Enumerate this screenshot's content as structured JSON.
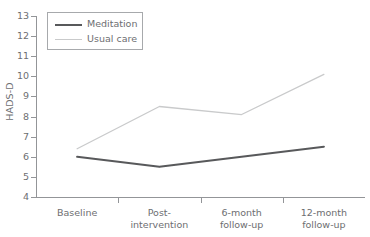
{
  "chart_data": {
    "type": "line",
    "title": "",
    "xlabel": "",
    "ylabel": "HADS-D",
    "categories": [
      "Baseline",
      "Post-\nintervention",
      "6-month\nfollow-up",
      "12-month\nfollow-up"
    ],
    "ylim": [
      4,
      13
    ],
    "yticks": [
      4,
      5,
      6,
      7,
      8,
      9,
      10,
      11,
      12,
      13
    ],
    "grid": false,
    "legend_position": "upper-left-inside",
    "series": [
      {
        "name": "Meditation",
        "color": "#58595b",
        "values": [
          6.0,
          5.5,
          6.0,
          6.5
        ]
      },
      {
        "name": "Usual care",
        "color": "#c9cacb",
        "values": [
          6.4,
          8.5,
          8.1,
          10.1
        ]
      }
    ]
  },
  "axes": {
    "y_label": "HADS-D",
    "y_ticks": [
      "13",
      "12",
      "11",
      "10",
      "9",
      "8",
      "7",
      "6",
      "5",
      "4"
    ],
    "x_ticks": [
      {
        "line1": "Baseline",
        "line2": ""
      },
      {
        "line1": "Post-",
        "line2": "intervention"
      },
      {
        "line1": "6-month",
        "line2": "follow-up"
      },
      {
        "line1": "12-month",
        "line2": "follow-up"
      }
    ]
  },
  "legend": {
    "items": [
      {
        "label": "Meditation",
        "color": "#58595b"
      },
      {
        "label": "Usual care",
        "color": "#c9cacb"
      }
    ]
  }
}
